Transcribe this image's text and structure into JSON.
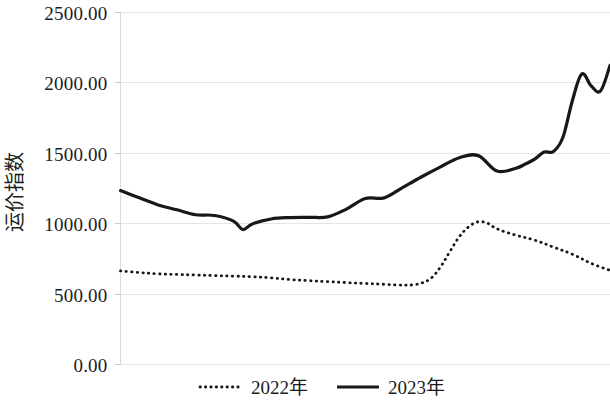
{
  "chart_data": {
    "type": "line",
    "title": "",
    "xlabel": "",
    "ylabel": "运价指数",
    "ylim": [
      0,
      2500
    ],
    "yticks": [
      0,
      500,
      1000,
      1500,
      2000,
      2500
    ],
    "ytick_labels": [
      "0.00",
      "500.00",
      "1000.00",
      "1500.00",
      "2000.00",
      "2500.00"
    ],
    "xlim": [
      0,
      52
    ],
    "grid": "horizontal",
    "legend_position": "bottom",
    "series": [
      {
        "name": "2022年",
        "style": "dotted",
        "color": "#181818",
        "x": [
          0,
          2,
          4,
          6,
          8,
          10,
          12,
          14,
          16,
          18,
          20,
          22,
          24,
          26,
          28,
          30,
          31,
          32,
          33,
          34,
          35,
          36,
          37,
          38,
          39,
          40,
          42,
          44,
          46,
          48,
          50,
          52
        ],
        "values": [
          662,
          650,
          640,
          636,
          632,
          628,
          624,
          620,
          612,
          600,
          592,
          585,
          578,
          572,
          566,
          560,
          562,
          575,
          610,
          690,
          800,
          905,
          975,
          1010,
          1000,
          960,
          915,
          880,
          830,
          780,
          715,
          665
        ]
      },
      {
        "name": "2023年",
        "style": "solid",
        "color": "#181818",
        "x": [
          0,
          2,
          4,
          6,
          8,
          10,
          12,
          13,
          14,
          16,
          18,
          20,
          22,
          24,
          26,
          28,
          30,
          32,
          34,
          36,
          38,
          40,
          42,
          43,
          44,
          45,
          46,
          47,
          48,
          49,
          50,
          51,
          52
        ],
        "values": [
          1232,
          1180,
          1130,
          1095,
          1060,
          1055,
          1015,
          955,
          995,
          1030,
          1040,
          1042,
          1045,
          1100,
          1175,
          1180,
          1255,
          1330,
          1400,
          1465,
          1480,
          1370,
          1390,
          1420,
          1455,
          1505,
          1510,
          1610,
          1870,
          2060,
          1975,
          1940,
          2120
        ]
      }
    ]
  },
  "legend": {
    "items": [
      {
        "label": "2022年",
        "style": "dotted"
      },
      {
        "label": "2023年",
        "style": "solid"
      }
    ]
  }
}
